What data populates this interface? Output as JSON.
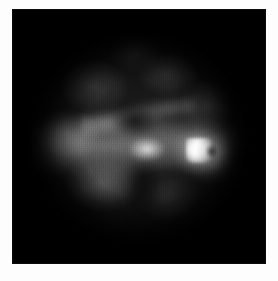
{
  "document": {
    "type": "medical-image",
    "modality_hint": "grayscale-circular-field-of-view",
    "caption": "",
    "title": ""
  },
  "canvas": {
    "width": 278,
    "height": 281,
    "background_color": "#fdfdfd",
    "margin_color": "#ffffff"
  },
  "image_panel": {
    "left": 12,
    "top": 9,
    "width": 254,
    "height": 255,
    "background_color": "#000000",
    "border_color": "#0c0c0c"
  },
  "field_of_view": {
    "shape": "circle",
    "center_x": 139,
    "center_y": 138,
    "radius": 112,
    "rim_color": "#000000",
    "base_color": "#1d1d1d"
  },
  "features": [
    {
      "name": "bright-nucleus",
      "label": "",
      "center_x": 182,
      "center_y": 138,
      "intensity": 255,
      "color": "#ffffff"
    },
    {
      "name": "bright-halo",
      "label": "",
      "center_x": 183,
      "center_y": 140,
      "intensity": 200,
      "color": "#ebebeb"
    },
    {
      "name": "secondary-bright-patch",
      "label": "",
      "center_x": 135,
      "center_y": 143,
      "intensity": 220,
      "color": "#e4e4e4"
    },
    {
      "name": "horizontal-tissue-band",
      "label": "",
      "center_x": 132,
      "center_y": 140,
      "intensity": 150,
      "color": "#9e9e9e"
    },
    {
      "name": "upper-ridge",
      "label": "",
      "center_x": 135,
      "center_y": 115,
      "intensity": 165,
      "color": "#aaaaaa"
    },
    {
      "name": "dark-pocket",
      "label": "",
      "center_x": 125,
      "center_y": 110,
      "intensity": 20,
      "color": "#141414"
    },
    {
      "name": "left-gray-mass",
      "label": "",
      "center_x": 82,
      "center_y": 128,
      "intensity": 120,
      "color": "#787878"
    },
    {
      "name": "lower-left-gray-mass",
      "label": "",
      "center_x": 105,
      "center_y": 182,
      "intensity": 115,
      "color": "#767676"
    },
    {
      "name": "central-fissure",
      "label": "",
      "center_x": 140,
      "center_y": 195,
      "intensity": 10,
      "color": "#0a0a0a"
    }
  ],
  "texture": {
    "name": "vertical-scanline-noise",
    "opacity_percent": 30
  },
  "overlays": {
    "annotations": [],
    "measurements": [],
    "scale_bar": null,
    "orientation_markers": []
  }
}
